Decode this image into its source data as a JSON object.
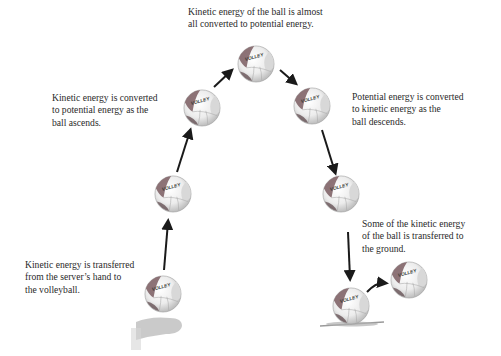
{
  "diagram": {
    "type": "energy-transformation",
    "captions": {
      "top": {
        "lines": [
          "Kinetic energy of the ball is almost",
          "all converted to potential energy."
        ]
      },
      "ascending": {
        "lines": [
          "Kinetic energy is converted",
          "to potential energy as the",
          "ball ascends."
        ]
      },
      "descending": {
        "lines": [
          "Potential energy is converted",
          "to kinetic energy as the",
          "ball descends."
        ]
      },
      "ground": {
        "lines": [
          "Some of the kinetic energy",
          "of the ball is transferred to",
          "the ground."
        ]
      },
      "serve": {
        "lines": [
          "Kinetic energy is transferred",
          "from the server’s hand to",
          "the volleyball."
        ]
      }
    },
    "ball_label": "VOLLEY",
    "balls": [
      {
        "id": "serve",
        "cx": 163,
        "cy": 294
      },
      {
        "id": "rising-low",
        "cx": 173,
        "cy": 194
      },
      {
        "id": "rising-high",
        "cx": 202,
        "cy": 108
      },
      {
        "id": "apex",
        "cx": 256,
        "cy": 64
      },
      {
        "id": "falling-high",
        "cx": 312,
        "cy": 106
      },
      {
        "id": "falling-low",
        "cx": 341,
        "cy": 194
      },
      {
        "id": "impact",
        "cx": 351,
        "cy": 306
      },
      {
        "id": "rebound",
        "cx": 409,
        "cy": 280
      }
    ],
    "colors": {
      "ball_white": "#f4f4f4",
      "ball_panel": "#7a5c60",
      "ball_shadow": "#8a8a8a",
      "arrow": "#1a1a1a",
      "text": "#2a2a2a",
      "hand": "#bdbdbd",
      "ground": "#9a9a9a"
    }
  }
}
